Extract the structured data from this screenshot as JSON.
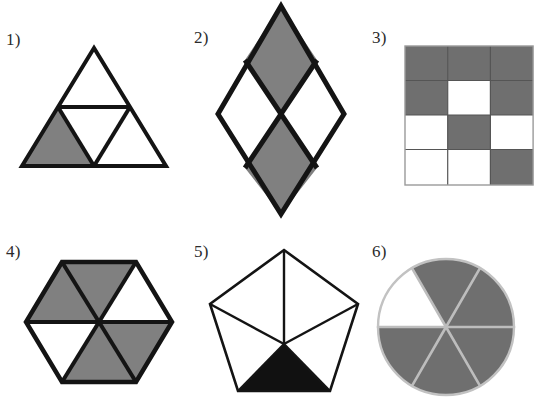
{
  "page": {
    "width": 539,
    "height": 403,
    "background": "#ffffff"
  },
  "palette": {
    "outline": "#141414",
    "gray_fill": "#808080",
    "gray_fill_dark": "#6f6f6f",
    "black_fill": "#111111",
    "white_fill": "#ffffff",
    "grid_line": "#4a4a4a",
    "circle_divider": "#b9b9b9",
    "label_text": "#2b2b2b"
  },
  "figures": [
    {
      "id": "figure-1",
      "label": "1)",
      "shape": "triangle",
      "description": "Equilateral triangle divided into four congruent triangles",
      "total_parts": 4,
      "shaded_parts": 1,
      "shaded_cells": [
        "bottom-left"
      ],
      "fill": "#808080",
      "label_x": 6,
      "label_y": 31,
      "art_x": 18,
      "art_y": 44,
      "art_w": 152,
      "art_h": 126
    },
    {
      "id": "figure-2",
      "label": "2)",
      "shape": "rhombus",
      "description": "Large rhombus divided into four congruent rhombi",
      "total_parts": 4,
      "shaded_parts": 2,
      "shaded_cells": [
        "top",
        "bottom"
      ],
      "fill": "#808080",
      "label_x": 194,
      "label_y": 29,
      "art_x": 210,
      "art_y": 2,
      "art_w": 142,
      "art_h": 216
    },
    {
      "id": "figure-3",
      "label": "3)",
      "shape": "grid",
      "description": "Rectangle divided into a 3 by 4 grid of equal cells",
      "columns": 3,
      "rows": 4,
      "total_parts": 12,
      "shaded_parts": 7,
      "grid_cells": [
        [
          "shaded",
          "shaded",
          "shaded"
        ],
        [
          "shaded",
          "white",
          "shaded"
        ],
        [
          "white",
          "shaded",
          "white"
        ],
        [
          "white",
          "white",
          "shaded"
        ]
      ],
      "fill": "#6f6f6f",
      "label_x": 372,
      "label_y": 29,
      "art_x": 404,
      "art_y": 45,
      "art_w": 130,
      "art_h": 142
    },
    {
      "id": "figure-4",
      "label": "4)",
      "shape": "hexagon",
      "description": "Regular hexagon divided into six congruent triangles",
      "total_parts": 6,
      "shaded_parts": 4,
      "shaded_cells": [
        "top-left",
        "top-right",
        "bottom-right",
        "bottom"
      ],
      "sector_fills": [
        "shaded",
        "white",
        "shaded",
        "shaded",
        "white",
        "shaded"
      ],
      "fill": "#808080",
      "label_x": 6,
      "label_y": 243,
      "art_x": 20,
      "art_y": 258,
      "art_w": 158,
      "art_h": 128
    },
    {
      "id": "figure-5",
      "label": "5)",
      "shape": "pentagon",
      "description": "Regular pentagon divided into five triangles from the center",
      "total_parts": 5,
      "shaded_parts": 1,
      "shaded_cells": [
        "bottom"
      ],
      "sector_fills": [
        "white",
        "white",
        "shaded",
        "white",
        "white"
      ],
      "fill": "#111111",
      "label_x": 194,
      "label_y": 243,
      "art_x": 202,
      "art_y": 244,
      "art_w": 164,
      "art_h": 158
    },
    {
      "id": "figure-6",
      "label": "6)",
      "shape": "circle",
      "description": "Circle divided into six equal sectors",
      "total_parts": 6,
      "shaded_parts": 5,
      "shaded_cells": [
        "all except upper-left"
      ],
      "sector_fills": [
        "shaded",
        "shaded",
        "white",
        "shaded",
        "shaded",
        "shaded"
      ],
      "fill": "#6f6f6f",
      "label_x": 372,
      "label_y": 243,
      "art_x": 373,
      "art_y": 254,
      "art_w": 146,
      "art_h": 146
    }
  ]
}
